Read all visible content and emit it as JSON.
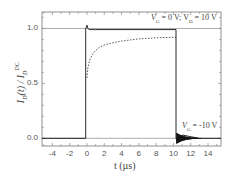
{
  "chart_data": {
    "type": "line",
    "title": "",
    "xlabel": "t (µs)",
    "ylabel": "I_D(t) / I_D^DC",
    "xlim": [
      -5.2,
      15.5
    ],
    "ylim": [
      -0.07,
      1.15
    ],
    "grid": false,
    "x_ticks": [
      -4,
      -2,
      0,
      2,
      4,
      6,
      8,
      10,
      12,
      14
    ],
    "x_tick_labels": [
      "-4",
      "-2",
      "0",
      "2",
      "4",
      "6",
      "8",
      "10",
      "12",
      "14"
    ],
    "y_ticks": [
      0.0,
      0.5,
      1.0
    ],
    "y_tick_labels": [
      "0.0",
      "0.5",
      "1.0"
    ],
    "annotations": [
      {
        "text": "V_G = 0 V; V_D = 10 V",
        "x": 15.3,
        "y": 1.08
      },
      {
        "text": "V_G = -10 V",
        "x": 15.3,
        "y": 0.09
      }
    ],
    "reference_lines": [
      {
        "orientation": "horizontal",
        "y": 1.0,
        "style": "solid-gray"
      },
      {
        "orientation": "horizontal",
        "y": 0.0,
        "style": "solid-gray"
      }
    ],
    "series": [
      {
        "name": "normalized drain current (solid)",
        "style": "solid",
        "x": [
          -5.2,
          -0.15,
          -0.15,
          0.0,
          0.1,
          0.3,
          0.6,
          1.0,
          10.3,
          10.3,
          10.5,
          11.0,
          12.0,
          13.0,
          15.5
        ],
        "y": [
          0.0,
          0.0,
          1.0,
          1.03,
          1.0,
          0.99,
          0.99,
          0.99,
          0.99,
          0.0,
          -0.04,
          0.03,
          0.015,
          0.0,
          0.0
        ]
      },
      {
        "name": "slow response (dashed)",
        "style": "dashed",
        "x": [
          0.0,
          0.1,
          0.3,
          0.6,
          1.0,
          1.5,
          2.0,
          3.0,
          4.0,
          5.0,
          6.0,
          8.0,
          10.0,
          10.3
        ],
        "y": [
          0.55,
          0.64,
          0.71,
          0.76,
          0.8,
          0.83,
          0.85,
          0.87,
          0.885,
          0.895,
          0.905,
          0.915,
          0.92,
          0.92
        ]
      }
    ]
  },
  "labels": {
    "ylabel_main": "I",
    "ylabel_sub": "D",
    "ylabel_mid": "(t) / I",
    "ylabel_sub2": "D",
    "ylabel_sup": "DC",
    "xlabel": "t (µs)",
    "annot_top": "V",
    "annot_top_sub": "G",
    "annot_top_mid": " = 0 V;  V",
    "annot_top_sub2": "D",
    "annot_top_end": " = 10 V",
    "annot_bottom": "V",
    "annot_bottom_sub": "G",
    "annot_bottom_end": " = -10 V"
  },
  "colors": {
    "axis": "#777777",
    "trace": "#111111",
    "ref_line": "#888888",
    "text": "#444444"
  }
}
